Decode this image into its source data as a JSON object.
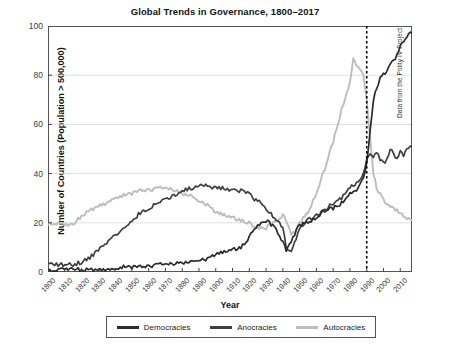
{
  "chart_data": {
    "type": "line",
    "title": "Global Trends in Governance, 1800–2017",
    "xlabel": "Year",
    "ylabel": "Number of Countries (Population > 500,000)",
    "xlim": [
      1800,
      2017
    ],
    "ylim": [
      0,
      100
    ],
    "ytick_labels": [
      "0",
      "20",
      "40",
      "60",
      "80",
      "100"
    ],
    "yticks": [
      0,
      20,
      40,
      60,
      80,
      100
    ],
    "xtick_labels": [
      "1800",
      "1810",
      "1820",
      "1830",
      "1840",
      "1850",
      "1860",
      "1870",
      "1880",
      "1890",
      "1900",
      "1910",
      "1920",
      "1930",
      "1940",
      "1950",
      "1960",
      "1970",
      "1980",
      "1990",
      "2000",
      "2010"
    ],
    "xticks": [
      1800,
      1810,
      1820,
      1830,
      1840,
      1850,
      1860,
      1870,
      1880,
      1890,
      1900,
      1910,
      1920,
      1930,
      1940,
      1950,
      1960,
      1970,
      1980,
      1990,
      2000,
      2010
    ],
    "grid": "horizontal",
    "legend_position": "bottom",
    "annotation_note": "Data from the Polity IV Project",
    "vline": {
      "x": 1990,
      "style": "dotted",
      "color": "#000000"
    },
    "colors": {
      "democracies": "#2b2b2b",
      "anocracies": "#3f3f3f",
      "autocracies": "#bdbdbd"
    },
    "series": [
      {
        "name": "Democracies",
        "color": "#2b2b2b",
        "x": [
          1800,
          1805,
          1810,
          1815,
          1820,
          1825,
          1830,
          1835,
          1840,
          1845,
          1850,
          1855,
          1860,
          1865,
          1870,
          1875,
          1880,
          1885,
          1890,
          1895,
          1900,
          1905,
          1910,
          1915,
          1920,
          1922,
          1925,
          1930,
          1935,
          1938,
          1940,
          1942,
          1945,
          1948,
          1950,
          1955,
          1960,
          1965,
          1970,
          1975,
          1980,
          1985,
          1988,
          1990,
          1992,
          1994,
          1996,
          1998,
          2000,
          2002,
          2004,
          2006,
          2008,
          2010,
          2012,
          2014,
          2016,
          2017
        ],
        "values": [
          1,
          1,
          1,
          1,
          1,
          1,
          1,
          1,
          1,
          2,
          2,
          2,
          2,
          3,
          3,
          3,
          4,
          4,
          5,
          5,
          7,
          8,
          9,
          10,
          14,
          17,
          19,
          21,
          18,
          15,
          12,
          9,
          12,
          17,
          19,
          20,
          22,
          25,
          26,
          28,
          32,
          34,
          38,
          44,
          57,
          70,
          75,
          79,
          80,
          82,
          84,
          86,
          88,
          92,
          94,
          96,
          97,
          97
        ]
      },
      {
        "name": "Anocracies",
        "color": "#3f3f3f",
        "x": [
          1800,
          1805,
          1810,
          1815,
          1820,
          1825,
          1830,
          1835,
          1840,
          1845,
          1850,
          1855,
          1860,
          1865,
          1870,
          1875,
          1880,
          1885,
          1890,
          1895,
          1900,
          1905,
          1910,
          1915,
          1920,
          1922,
          1925,
          1930,
          1935,
          1938,
          1940,
          1942,
          1945,
          1948,
          1950,
          1955,
          1960,
          1965,
          1970,
          1975,
          1980,
          1985,
          1988,
          1990,
          1992,
          1994,
          1996,
          1998,
          2000,
          2002,
          2004,
          2006,
          2008,
          2010,
          2012,
          2014,
          2016,
          2017
        ],
        "values": [
          3,
          3,
          3,
          3,
          4,
          6,
          9,
          12,
          15,
          18,
          21,
          24,
          26,
          28,
          30,
          31,
          33,
          34,
          35,
          35,
          34,
          34,
          33,
          33,
          32,
          30,
          29,
          26,
          22,
          20,
          18,
          10,
          9,
          14,
          18,
          21,
          23,
          25,
          28,
          30,
          34,
          37,
          40,
          45,
          48,
          47,
          49,
          46,
          44,
          46,
          50,
          48,
          46,
          49,
          47,
          50,
          51,
          51
        ]
      },
      {
        "name": "Autocracies",
        "color": "#bdbdbd",
        "x": [
          1800,
          1805,
          1810,
          1815,
          1820,
          1825,
          1830,
          1835,
          1840,
          1845,
          1850,
          1855,
          1860,
          1865,
          1870,
          1875,
          1880,
          1885,
          1890,
          1895,
          1900,
          1905,
          1910,
          1915,
          1920,
          1922,
          1925,
          1930,
          1935,
          1938,
          1940,
          1942,
          1945,
          1948,
          1950,
          1955,
          1960,
          1965,
          1970,
          1975,
          1980,
          1982,
          1985,
          1988,
          1990,
          1992,
          1994,
          1996,
          1998,
          2000,
          2002,
          2004,
          2006,
          2008,
          2010,
          2012,
          2014,
          2016,
          2017
        ],
        "values": [
          20,
          20,
          19,
          19,
          23,
          25,
          27,
          28,
          30,
          31,
          32,
          33,
          33,
          34,
          34,
          33,
          32,
          31,
          29,
          27,
          24,
          23,
          22,
          21,
          20,
          19,
          18,
          18,
          20,
          22,
          23,
          21,
          15,
          17,
          20,
          24,
          32,
          42,
          53,
          66,
          77,
          87,
          83,
          80,
          70,
          55,
          40,
          34,
          32,
          29,
          28,
          26,
          26,
          25,
          24,
          23,
          22,
          21,
          21
        ]
      }
    ]
  },
  "legend": {
    "items": [
      {
        "label": "Democracies",
        "color": "#2b2b2b"
      },
      {
        "label": "Anocracies",
        "color": "#3f3f3f"
      },
      {
        "label": "Autocracies",
        "color": "#bdbdbd"
      }
    ]
  }
}
